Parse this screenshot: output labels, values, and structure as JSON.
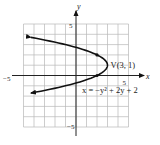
{
  "chart_data": {
    "type": "line",
    "title": "",
    "xlabel": "x",
    "ylabel": "y",
    "xlim": [
      -5,
      5
    ],
    "ylim": [
      -5,
      5
    ],
    "grid": true,
    "tick_labels": {
      "x_min": "−5",
      "x_max": "5",
      "y_min": "−5",
      "y_max": "5"
    },
    "series": [
      {
        "name": "x = −y² + 2y + 2",
        "equation": "x = -y^2 + 2y + 2",
        "y_range": [
          -1.7,
          3.7
        ],
        "arrows": "both-ends"
      }
    ],
    "points": [
      {
        "x": 2,
        "y": 0
      },
      {
        "x": 2,
        "y": 2
      }
    ],
    "annotations": [
      {
        "text": "V(3, 1)",
        "x": 3,
        "y": 1
      },
      {
        "text": "x = −y² + 2y + 2",
        "x": 0.5,
        "y": -0.6
      }
    ]
  }
}
